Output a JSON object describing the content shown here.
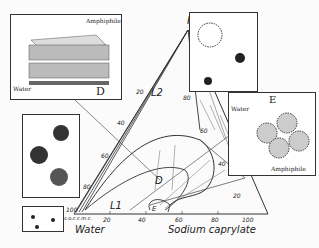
{
  "diagram": {
    "type": "ternary-phase-diagram",
    "vertices": {
      "top": "Pentanol",
      "bottom_left": "Water",
      "bottom_right": "Sodium caprylate"
    },
    "vertex_values": {
      "top": "100",
      "bottom_left": "100",
      "bottom_right": "100"
    },
    "bottom_axis_ticks": [
      "20",
      "40",
      "60",
      "80",
      "100"
    ],
    "left_axis_ticks": [
      "20",
      "40",
      "60",
      "80",
      "100"
    ],
    "right_axis_ticks": [
      "80",
      "60",
      "40",
      "20"
    ],
    "bottom_axis_extra_labels": [
      "s.o.c.",
      "c.m.c."
    ],
    "regions": [
      {
        "label": "L2"
      },
      {
        "label": "D"
      },
      {
        "label": "L1"
      },
      {
        "label": "E"
      }
    ]
  },
  "insets": {
    "lamellar": {
      "letter": "D",
      "labels": [
        "Amphiphile",
        "Water"
      ]
    },
    "hexagonal": {
      "letter": "E",
      "labels": [
        "Water",
        "Amphiphile"
      ]
    },
    "reverse_micelles": {
      "description": "reverse micelle sketches"
    },
    "normal_micelles": {
      "description": "normal micelle sketches"
    },
    "monomers": {
      "description": "dispersed amphiphile monomers"
    }
  }
}
